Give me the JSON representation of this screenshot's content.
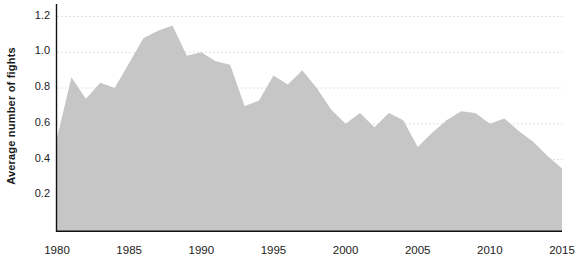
{
  "chart_data": {
    "type": "area",
    "title": "",
    "xlabel": "",
    "ylabel": "Average number of fights",
    "xlim": [
      1980,
      2015
    ],
    "ylim": [
      0,
      1.27
    ],
    "grid": true,
    "grid_axis": "y",
    "legend": "none",
    "area_color": "#c6c6c6",
    "grid_color": "#d8d8d8",
    "axis_color": "#111111",
    "x_ticks": [
      1980,
      1985,
      1990,
      1995,
      2000,
      2005,
      2010,
      2015
    ],
    "y_ticks": [
      0.2,
      0.4,
      0.6,
      0.8,
      1.0,
      1.2
    ],
    "y_tick_labels": [
      "0.2",
      "0.4",
      "0.6",
      "0.8",
      "1.0",
      "1.2"
    ],
    "x": [
      1980,
      1981,
      1982,
      1983,
      1984,
      1985,
      1986,
      1987,
      1988,
      1989,
      1990,
      1991,
      1992,
      1993,
      1994,
      1995,
      1996,
      1997,
      1998,
      1999,
      2000,
      2001,
      2002,
      2003,
      2004,
      2005,
      2006,
      2007,
      2008,
      2009,
      2010,
      2011,
      2012,
      2013,
      2014,
      2015
    ],
    "values": [
      0.52,
      0.86,
      0.74,
      0.83,
      0.8,
      0.94,
      1.08,
      1.12,
      1.15,
      0.98,
      1.0,
      0.95,
      0.93,
      0.7,
      0.73,
      0.87,
      0.82,
      0.9,
      0.8,
      0.68,
      0.6,
      0.66,
      0.58,
      0.66,
      0.62,
      0.47,
      0.55,
      0.62,
      0.67,
      0.66,
      0.6,
      0.63,
      0.56,
      0.5,
      0.42,
      0.35
    ]
  }
}
